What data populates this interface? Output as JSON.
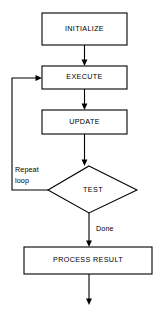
{
  "diagram": {
    "type": "flowchart",
    "canvas": {
      "width": 160,
      "height": 315
    },
    "colors": {
      "background": "#ffffff",
      "stroke": "#000000",
      "text": "#000000",
      "fill": "#ffffff"
    },
    "nodes": [
      {
        "id": "initialize",
        "shape": "process",
        "label": "INITIALIZE",
        "x": 42,
        "y": 13,
        "width": 85,
        "height": 32,
        "cx": 84.5,
        "cy": 29
      },
      {
        "id": "execute",
        "shape": "process",
        "label": "EXECUTE",
        "x": 42,
        "y": 66,
        "width": 85,
        "height": 23,
        "cx": 84.5,
        "cy": 77.5
      },
      {
        "id": "update",
        "shape": "process",
        "label": "UPDATE",
        "x": 42,
        "y": 110,
        "width": 85,
        "height": 24,
        "cx": 84.5,
        "cy": 122
      },
      {
        "id": "test",
        "shape": "decision",
        "label": "TEST",
        "points": "89,166 137,190 89,213 48,190",
        "cx": 93,
        "cy": 190
      },
      {
        "id": "process-result",
        "shape": "process",
        "label": "PROCESS RESULT",
        "x": 24,
        "y": 247,
        "width": 128,
        "height": 27,
        "cx": 88,
        "cy": 260.5
      }
    ],
    "edges": [
      {
        "id": "initialize-to-execute",
        "from": "initialize",
        "to": "execute",
        "label": "",
        "path": "M 84.5 45 L 84.5 62",
        "arrow": "84.5,66 81.6,59.5 87.4,59.5"
      },
      {
        "id": "execute-to-update",
        "from": "execute",
        "to": "update",
        "label": "",
        "path": "M 84.5 89 L 84.5 106",
        "arrow": "84.5,110 81.6,103.5 87.4,103.5"
      },
      {
        "id": "update-to-test",
        "from": "update",
        "to": "test",
        "label": "",
        "path": "M 84.5 134 L 84.5 162",
        "arrow": "84.5,166 81.6,159.5 87.4,159.5"
      },
      {
        "id": "test-to-execute-loop",
        "from": "test",
        "to": "execute",
        "label": "Repeat loop",
        "label_lines": [
          "Repeat",
          "loop"
        ],
        "label_x": 15,
        "label_y1": 170,
        "label_y2": 181,
        "path": "M 48 190 L 12 190 L 12 78 L 38 78",
        "arrow": "42,78 35.5,75.1 35.5,80.9"
      },
      {
        "id": "test-to-process-result",
        "from": "test",
        "to": "process-result",
        "label": "Done",
        "label_x": 96,
        "label_y": 229,
        "path": "M 89 213 L 89 243",
        "arrow": "89,247 86.1,240.5 91.9,240.5"
      },
      {
        "id": "process-result-to-end",
        "from": "process-result",
        "to": "end",
        "label": "",
        "path": "M 89 274 L 89 301",
        "arrow": "89,305 86.1,298.5 91.9,298.5"
      }
    ]
  }
}
